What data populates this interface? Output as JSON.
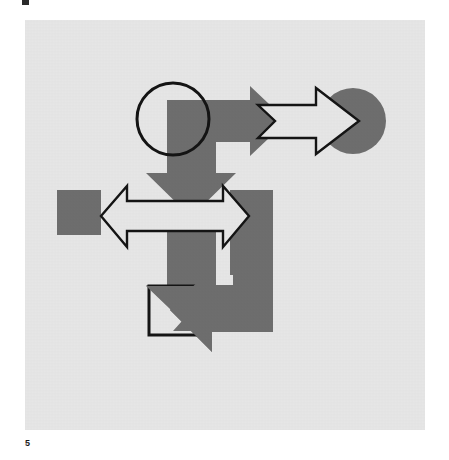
{
  "document": {
    "page_number": "5",
    "corner_mark": "█"
  },
  "figure": {
    "background_color": "#e6e6e6",
    "page_color": "#ffffff",
    "fill_gray": "#6e6e6e",
    "outline_black": "#141414",
    "outline_fill": "#e6e6e6",
    "panel": {
      "x": 25,
      "y": 20,
      "width": 400,
      "height": 410
    },
    "shapes": [
      {
        "name": "gray-right-arrow-top",
        "type": "arrow",
        "direction": "right",
        "style": "filled-gray",
        "points": "142,80 225,80 225,66 262,101 225,136 225,122 142,122"
      },
      {
        "name": "gray-down-arrow-upper",
        "type": "arrow",
        "direction": "down",
        "style": "filled-gray",
        "points": "142,80 191,80 191,153 211,153 166,197 121,153 142,153"
      },
      {
        "name": "black-outline-circle",
        "type": "circle",
        "style": "outline",
        "cx": 148,
        "cy": 99,
        "r": 36
      },
      {
        "name": "gray-circle-right",
        "type": "circle",
        "style": "filled-gray",
        "cx": 328,
        "cy": 101,
        "r": 33
      },
      {
        "name": "outline-right-arrow",
        "type": "arrow",
        "direction": "right",
        "style": "outline",
        "points": "233,85 291,85 291,68 334,101 291,134 291,118 233,118 250,101"
      },
      {
        "name": "gray-square-left",
        "type": "rect",
        "style": "filled-gray",
        "x": 32,
        "y": 170,
        "width": 44,
        "height": 45
      },
      {
        "name": "gray-block-right",
        "type": "bracket",
        "style": "filled-gray",
        "points": "205,170 248,170 248,311 148,311 166,291 208,291 208,255 205,255"
      },
      {
        "name": "outline-double-arrow",
        "type": "arrow",
        "direction": "left-right",
        "style": "outline",
        "points": "76,196 102,166 102,181 198,181 198,166 224,196 198,227 198,211 102,211 102,227"
      },
      {
        "name": "gray-down-arrow-lower",
        "type": "arrow",
        "direction": "down",
        "style": "filled-gray",
        "points": "142,192 191,192 191,265 211,265 166,309 121,265 142,265"
      },
      {
        "name": "gray-left-arrow-bottom",
        "type": "arrow",
        "direction": "left",
        "style": "filled-gray",
        "points": "248,267 187,267 187,247 145,290 187,332 187,312 248,312"
      },
      {
        "name": "outline-square-bottom",
        "type": "rect",
        "style": "outline",
        "x": 124,
        "y": 266,
        "width": 48,
        "height": 49
      }
    ]
  }
}
